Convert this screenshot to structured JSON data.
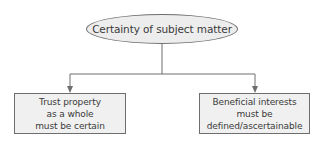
{
  "diagram": {
    "type": "tree",
    "root": {
      "label": "Certainty of subject matter",
      "shape": "ellipse"
    },
    "children": [
      {
        "lines": [
          "Trust property",
          "as a whole",
          "must be certain"
        ],
        "shape": "rectangle"
      },
      {
        "lines": [
          "Beneficial interests",
          "must be",
          "defined/ascertainable"
        ],
        "shape": "rectangle"
      }
    ],
    "colors": {
      "node_fill": "#ededed",
      "box_fill": "#f0f0f0",
      "stroke": "#6e6e6e",
      "text": "#3a3a3a",
      "background": "#ffffff"
    }
  }
}
